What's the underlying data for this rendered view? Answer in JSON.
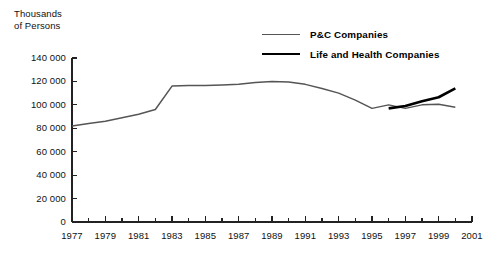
{
  "chart_data": {
    "type": "line",
    "title": "",
    "ylabel": "Thousands\nof Persons",
    "xlabel": "",
    "ylim": [
      0,
      140000
    ],
    "xlim": [
      1977,
      2001
    ],
    "grid": false,
    "legend_position": "top-center",
    "ytick_labels": [
      "140 000",
      "120 000",
      "100 000",
      "80 000",
      "60 000",
      "40 000",
      "20 000",
      "0"
    ],
    "ytick_values": [
      140000,
      120000,
      100000,
      80000,
      60000,
      40000,
      20000,
      0
    ],
    "xtick_labels": [
      "1977",
      "1979",
      "1981",
      "1983",
      "1985",
      "1987",
      "1989",
      "1991",
      "1993",
      "1995",
      "1997",
      "1999",
      "2001"
    ],
    "xtick_values": [
      1977,
      1979,
      1981,
      1983,
      1985,
      1987,
      1989,
      1991,
      1993,
      1995,
      1997,
      1999,
      2001
    ],
    "xtick_minor_values": [
      1978,
      1980,
      1982,
      1984,
      1986,
      1988,
      1990,
      1992,
      1994,
      1996,
      1998,
      2000
    ],
    "series": [
      {
        "name": "P&C Companies",
        "color": "#555555",
        "width": 1.5,
        "x": [
          1977,
          1978,
          1979,
          1980,
          1981,
          1982,
          1983,
          1984,
          1985,
          1986,
          1987,
          1988,
          1989,
          1990,
          1991,
          1992,
          1993,
          1994,
          1995,
          1996,
          1997,
          1998,
          1999,
          2000
        ],
        "values": [
          82000,
          84000,
          86000,
          89000,
          92000,
          96000,
          116000,
          116500,
          116500,
          117000,
          117500,
          119000,
          120000,
          119500,
          117500,
          114000,
          110000,
          104000,
          97000,
          100000,
          97000,
          100000,
          100500,
          98000
        ]
      },
      {
        "name": "Life and Health Companies",
        "color": "#000000",
        "width": 2.6,
        "x": [
          1996,
          1997,
          1998,
          1999,
          2000
        ],
        "values": [
          97000,
          99000,
          103000,
          106500,
          114000
        ]
      }
    ]
  },
  "legend": {
    "items": [
      {
        "label": "P&C Companies",
        "style": "pc"
      },
      {
        "label": "Life and Health Companies",
        "style": "lh"
      }
    ]
  }
}
